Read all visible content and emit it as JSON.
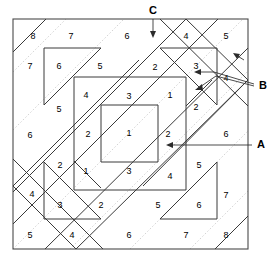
{
  "figure": {
    "background_color": "#ffffff",
    "line_color": "#3a3a3a",
    "guide_color": "#cfcfcf",
    "width": 278,
    "height": 265
  },
  "callouts": [
    {
      "id": "A",
      "label": "A",
      "x": 261,
      "y": 145,
      "arrow_to_x": 168,
      "arrow_to_y": 145
    },
    {
      "id": "B",
      "label": "B",
      "x": 263,
      "y": 86,
      "arrow_to_x": 196,
      "arrow_to_y": 75
    },
    {
      "id": "C",
      "label": "C",
      "x": 153,
      "y": 11,
      "arrow_to_x": 153,
      "arrow_to_y": 37
    }
  ],
  "patches": [
    {
      "n": "8",
      "x": 33,
      "y": 37
    },
    {
      "n": "7",
      "x": 71,
      "y": 37
    },
    {
      "n": "6",
      "x": 127,
      "y": 37
    },
    {
      "n": "4",
      "x": 186,
      "y": 37
    },
    {
      "n": "5",
      "x": 226,
      "y": 37
    },
    {
      "n": "7",
      "x": 30,
      "y": 67
    },
    {
      "n": "6",
      "x": 59,
      "y": 67
    },
    {
      "n": "5",
      "x": 100,
      "y": 67
    },
    {
      "n": "2",
      "x": 155,
      "y": 68
    },
    {
      "n": "3",
      "x": 196,
      "y": 67
    },
    {
      "n": "4",
      "x": 226,
      "y": 79
    },
    {
      "n": "5",
      "x": 59,
      "y": 110
    },
    {
      "n": "4",
      "x": 86,
      "y": 96
    },
    {
      "n": "3",
      "x": 129,
      "y": 97
    },
    {
      "n": "1",
      "x": 170,
      "y": 96
    },
    {
      "n": "2",
      "x": 196,
      "y": 108
    },
    {
      "n": "6",
      "x": 30,
      "y": 136
    },
    {
      "n": "2",
      "x": 88,
      "y": 135
    },
    {
      "n": "1",
      "x": 129,
      "y": 134
    },
    {
      "n": "2",
      "x": 168,
      "y": 135
    },
    {
      "n": "6",
      "x": 226,
      "y": 135
    },
    {
      "n": "2",
      "x": 60,
      "y": 166
    },
    {
      "n": "1",
      "x": 86,
      "y": 172
    },
    {
      "n": "3",
      "x": 129,
      "y": 172
    },
    {
      "n": "4",
      "x": 170,
      "y": 177
    },
    {
      "n": "5",
      "x": 199,
      "y": 166
    },
    {
      "n": "4",
      "x": 32,
      "y": 195
    },
    {
      "n": "3",
      "x": 60,
      "y": 206
    },
    {
      "n": "2",
      "x": 101,
      "y": 206
    },
    {
      "n": "5",
      "x": 158,
      "y": 206
    },
    {
      "n": "6",
      "x": 199,
      "y": 206
    },
    {
      "n": "7",
      "x": 226,
      "y": 196
    },
    {
      "n": "5",
      "x": 30,
      "y": 236
    },
    {
      "n": "4",
      "x": 72,
      "y": 236
    },
    {
      "n": "6",
      "x": 129,
      "y": 236
    },
    {
      "n": "7",
      "x": 186,
      "y": 236
    },
    {
      "n": "8",
      "x": 226,
      "y": 236
    }
  ],
  "geometry": {
    "outer_frame": {
      "x1": 13,
      "y1": 19,
      "x2": 248,
      "y2": 249
    },
    "mid_square": {
      "x1": 74,
      "y1": 77,
      "x2": 186,
      "y2": 190
    },
    "inner_square": {
      "x1": 101,
      "y1": 105,
      "x2": 158,
      "y2": 162
    }
  }
}
